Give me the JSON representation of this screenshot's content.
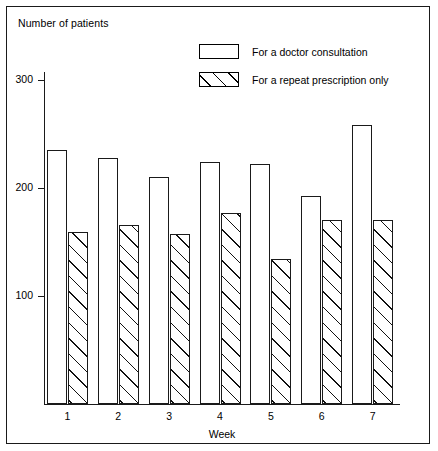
{
  "figure": {
    "y_axis_caption": "Number of patients",
    "x_axis_title": "Week"
  },
  "legend": {
    "items": [
      {
        "label": "For a doctor consultation",
        "pattern": "open",
        "swatch_name": "legend-swatch-doctor-consultation"
      },
      {
        "label": "For a repeat prescription only",
        "pattern": "hatched",
        "swatch_name": "legend-swatch-repeat-prescription"
      }
    ]
  },
  "chart_data": {
    "type": "bar",
    "title": "",
    "xlabel": "Week",
    "ylabel": "Number of patients",
    "categories": [
      "1",
      "2",
      "3",
      "4",
      "5",
      "6",
      "7"
    ],
    "yticks": [
      100,
      200,
      300
    ],
    "ylim": [
      0,
      310
    ],
    "grid": false,
    "legend_position": "top-right",
    "series": [
      {
        "name": "For a doctor consultation",
        "pattern": "open",
        "values": [
          235,
          228,
          210,
          224,
          222,
          193,
          258
        ]
      },
      {
        "name": "For a repeat prescription only",
        "pattern": "hatched",
        "values": [
          159,
          166,
          157,
          177,
          134,
          170,
          170
        ]
      }
    ]
  },
  "colors": {
    "ink": "#1a1a1a",
    "background": "#ffffff"
  }
}
